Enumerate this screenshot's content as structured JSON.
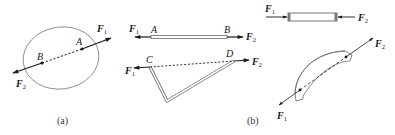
{
  "figure": {
    "part_a": {
      "caption": "(a)",
      "points": {
        "A": "A",
        "B": "B"
      },
      "forces": {
        "F1": {
          "base": "F",
          "sub": "1"
        },
        "F2": {
          "base": "F",
          "sub": "2"
        }
      }
    },
    "part_b": {
      "caption": "(b)",
      "straight_bar": {
        "points": {
          "A": "A",
          "B": "B"
        },
        "forces": {
          "F1": {
            "base": "F",
            "sub": "1"
          },
          "F2": {
            "base": "F",
            "sub": "2"
          }
        }
      },
      "bent_bar": {
        "points": {
          "C": "C",
          "D": "D"
        },
        "forces": {
          "F1": {
            "base": "F",
            "sub": "1"
          },
          "F2": {
            "base": "F",
            "sub": "2"
          }
        }
      },
      "compressed_rod": {
        "forces": {
          "F1": {
            "base": "F",
            "sub": "1"
          },
          "F2": {
            "base": "F",
            "sub": "2"
          }
        }
      },
      "curved_bar": {
        "forces": {
          "F1": {
            "base": "F",
            "sub": "1"
          },
          "F2": {
            "base": "F",
            "sub": "2"
          }
        }
      }
    },
    "colors": {
      "stroke": "#1a1a1a",
      "outline": "#6b6b6b"
    }
  }
}
